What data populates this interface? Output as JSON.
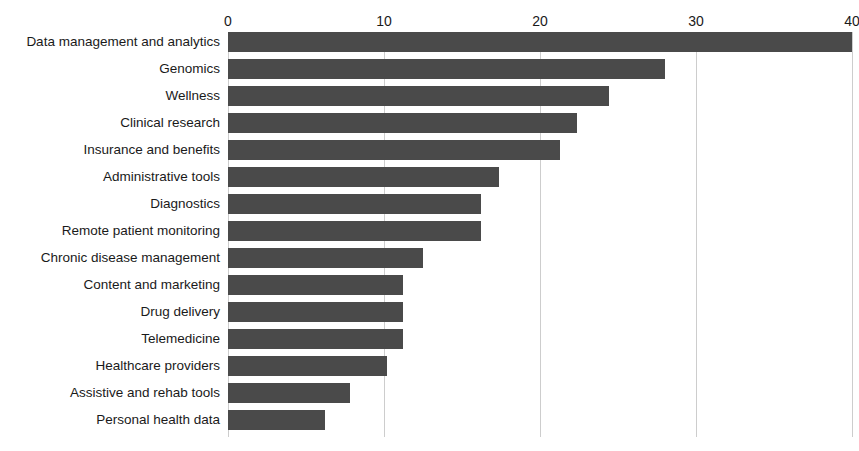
{
  "chart_data": {
    "type": "bar",
    "orientation": "horizontal",
    "title": "Digital health startups by category",
    "xlabel": "",
    "ylabel": "",
    "xlim": [
      0,
      40
    ],
    "x_ticks": [
      0,
      10,
      20,
      30,
      40
    ],
    "x_tick_labels": [
      "0",
      "10",
      "20",
      "30",
      "40"
    ],
    "grid": true,
    "grid_axis": "x",
    "legend": false,
    "bar_color": "#4a4a4a",
    "grid_color": "#cdcdcd",
    "text_color": "#1a1a1a",
    "categories": [
      "Data management and analytics",
      "Genomics",
      "Wellness",
      "Clinical research",
      "Insurance and benefits",
      "Administrative tools",
      "Diagnostics",
      "Remote patient monitoring",
      "Chronic disease management",
      "Content and marketing",
      "Drug delivery",
      "Telemedicine",
      "Healthcare providers",
      "Assistive and rehab tools",
      "Personal health data"
    ],
    "values": [
      40,
      28,
      24.4,
      22.4,
      21.3,
      17.4,
      16.2,
      16.2,
      12.5,
      11.2,
      11.2,
      11.2,
      10.2,
      7.8,
      6.2
    ]
  }
}
